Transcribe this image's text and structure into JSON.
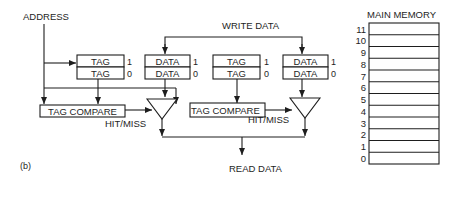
{
  "diagram": {
    "address_label": "ADDRESS",
    "write_data_label": "WRITE DATA",
    "read_data_label": "READ DATA",
    "figure_label": "(b)",
    "way0": {
      "tag_rows": [
        {
          "label": "TAG",
          "index": "1"
        },
        {
          "label": "TAG",
          "index": "0"
        }
      ],
      "data_rows": [
        {
          "label": "DATA",
          "index": "1"
        },
        {
          "label": "DATA",
          "index": "0"
        }
      ],
      "compare_label": "TAG COMPARE",
      "hitmiss_label": "HIT/MISS"
    },
    "way1": {
      "tag_rows": [
        {
          "label": "TAG",
          "index": "1"
        },
        {
          "label": "TAG",
          "index": "0"
        }
      ],
      "data_rows": [
        {
          "label": "DATA",
          "index": "1"
        },
        {
          "label": "DATA",
          "index": "0"
        }
      ],
      "compare_label": "TAG COMPARE",
      "hitmiss_label": "HIT/MISS"
    },
    "main_memory": {
      "title": "MAIN MEMORY",
      "rows": [
        "11",
        "10",
        "9",
        "8",
        "7",
        "6",
        "5",
        "4",
        "3",
        "2",
        "1",
        "0"
      ]
    }
  }
}
